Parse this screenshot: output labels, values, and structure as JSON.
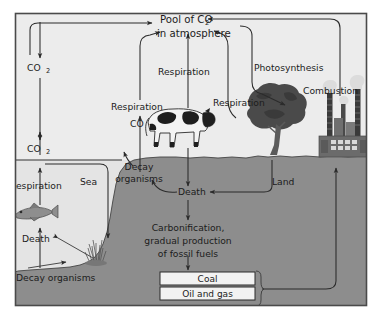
{
  "diagram": {
    "title_line1": "Pool of CO",
    "title_sub1": "2",
    "title_line2": "in atmosphere",
    "colors": {
      "sky": "#ececec",
      "sea": "#e3e3e3",
      "ground": "#8d8d8d",
      "line": "#2b2b2b",
      "text": "#1c1c1c",
      "box_fill": "#f2f2f2",
      "frame": "#4a4a4a",
      "page": "#ffffff",
      "tree": "#4d4d4d",
      "factory": "#6b6b6b",
      "smoke": "#d9d9d9"
    },
    "labels": {
      "co2_upper": "CO",
      "co2_upper_sub": "2",
      "co2_lower": "CO",
      "co2_lower_sub": "2",
      "co2_mid": "CO",
      "co2_mid_sub": "2",
      "respiration_sea": "Respiration",
      "death_sea": "Death",
      "decay_organisms_sea": "Decay organisms",
      "sea": "Sea",
      "respiration_left": "Respiration",
      "respiration_center": "Respiration",
      "respiration_right": "Respiration",
      "photosynthesis": "Photosynthesis",
      "combustion": "Combustion",
      "land": "Land",
      "decay_organisms_land_line1": "Decay",
      "decay_organisms_land_line2": "organisms",
      "death_land": "Death",
      "carbonification_line1": "Carbonification,",
      "carbonification_line2": "gradual production",
      "carbonification_line3": "of fossil fuels",
      "coal": "Coal",
      "oil_and_gas": "Oil and gas"
    }
  }
}
